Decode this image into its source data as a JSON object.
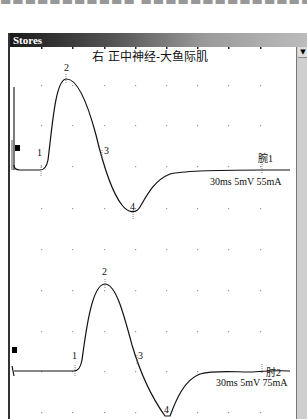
{
  "window": {
    "title": "Stores",
    "header": "右 正中神经-大鱼际肌"
  },
  "scrollbar": {
    "arrow": "▼"
  },
  "chart_data": [
    {
      "type": "line",
      "title": "右 正中神经-大鱼际肌",
      "trace_label": "腕1",
      "params": "30ms 5mV 55mA",
      "sweep": "30ms",
      "sensitivity": "5mV",
      "stimulus": "55mA",
      "markers": [
        {
          "label": "1",
          "x": 41,
          "y": 170
        },
        {
          "label": "2",
          "x": 66,
          "y": 79
        },
        {
          "label": "3",
          "x": 102,
          "y": 155
        },
        {
          "label": "4",
          "x": 133,
          "y": 213
        }
      ],
      "baseline_y": 170,
      "grid": true
    },
    {
      "type": "line",
      "title": "",
      "trace_label": "肘2",
      "params": "30ms 5mV 75mA",
      "sweep": "30ms",
      "sensitivity": "5mV",
      "stimulus": "75mA",
      "markers": [
        {
          "label": "1",
          "x": 75,
          "y": 370
        },
        {
          "label": "2",
          "x": 105,
          "y": 284
        },
        {
          "label": "3",
          "x": 137,
          "y": 360
        },
        {
          "label": "4",
          "x": 167,
          "y": 416
        }
      ],
      "baseline_y": 370,
      "grid": true
    }
  ],
  "traces": {
    "upper": {
      "label": "腕1",
      "params": "30ms 5mV 55mA",
      "m1": "1",
      "m2": "2",
      "m3": "3",
      "m4": "4"
    },
    "lower": {
      "label": "肘2",
      "params": "30ms 5mV 75mA",
      "m1": "1",
      "m2": "2",
      "m3": "3",
      "m4": "4"
    }
  }
}
